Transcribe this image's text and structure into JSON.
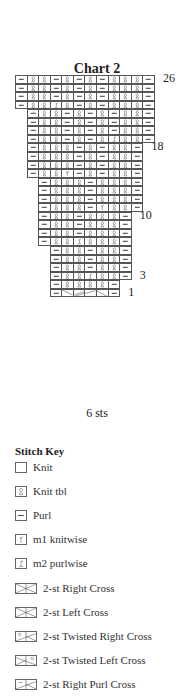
{
  "chart": {
    "title": "Chart  2",
    "width_label": "6 sts",
    "row_labels": [
      {
        "label": "26",
        "row": 26
      },
      {
        "label": "18",
        "row": 18
      },
      {
        "label": "10",
        "row": 10
      },
      {
        "label": "3",
        "row": 3
      },
      {
        "label": "1",
        "row": 1
      }
    ],
    "rows": [
      {
        "row": 26,
        "start": 0,
        "cells": [
          "P",
          "Ktbl",
          "Ktbl",
          "P",
          "Ktbl",
          "P",
          "Ktbl",
          "P",
          "Ktbl",
          "Ktbl",
          "Ktbl",
          "P"
        ]
      },
      {
        "row": 25,
        "start": 0,
        "cells": [
          "P",
          "Ktbl",
          "Ktbl",
          "P",
          "Ktbl",
          "P",
          "Ktbl",
          "P",
          "Ktbl",
          "Ktbl",
          "Ktbl",
          "P"
        ]
      },
      {
        "row": 24,
        "start": 0,
        "cells": [
          "P",
          "Ktbl",
          "Ktbl",
          "P",
          "Ktbl",
          "P",
          "Ktbl",
          "P",
          "Ktbl",
          "Ktbl",
          "Ktbl",
          "P"
        ]
      },
      {
        "row": 23,
        "start": 0,
        "cells": [
          "P",
          "Ktbl",
          "Ktbl",
          "M2P",
          "Ktbl",
          "P",
          "Ktbl",
          "P",
          "Ktbl",
          "Ktbl",
          "Ktbl",
          "P"
        ]
      },
      {
        "row": 22,
        "start": 1,
        "cells": [
          "P",
          "Ktbl",
          "Ktbl",
          "P",
          "Ktbl",
          "P",
          "Ktbl",
          "P",
          "Ktbl",
          "Ktbl",
          "P"
        ]
      },
      {
        "row": 21,
        "start": 1,
        "cells": [
          "P",
          "Ktbl",
          "Ktbl",
          "P",
          "Ktbl",
          "P",
          "Ktbl",
          "P",
          "Ktbl",
          "Ktbl",
          "P"
        ]
      },
      {
        "row": 20,
        "start": 1,
        "cells": [
          "P",
          "Ktbl",
          "Ktbl",
          "P",
          "Ktbl",
          "P",
          "Ktbl",
          "P",
          "Ktbl",
          "Ktbl",
          "P"
        ]
      },
      {
        "row": 19,
        "start": 1,
        "cells": [
          "P",
          "Ktbl",
          "Ktbl",
          "P",
          "Ktbl",
          "P",
          "Ktbl",
          "M2P",
          "Ktbl",
          "Ktbl",
          "P"
        ]
      },
      {
        "row": 18,
        "start": 1,
        "cells": [
          "P",
          "Ktbl",
          "Ktbl",
          "Ktbl",
          "P",
          "Ktbl",
          "P",
          "Ktbl",
          "Ktbl",
          "P"
        ]
      },
      {
        "row": 17,
        "start": 1,
        "cells": [
          "P",
          "Ktbl",
          "Ktbl",
          "Ktbl",
          "P",
          "Ktbl",
          "P",
          "Ktbl",
          "Ktbl",
          "P"
        ]
      },
      {
        "row": 16,
        "start": 1,
        "cells": [
          "P",
          "Ktbl",
          "Ktbl",
          "Ktbl",
          "P",
          "Ktbl",
          "P",
          "Ktbl",
          "Ktbl",
          "P"
        ]
      },
      {
        "row": 15,
        "start": 1,
        "cells": [
          "P",
          "Ktbl",
          "Ktbl",
          "M1K",
          "P",
          "Ktbl",
          "P",
          "Ktbl",
          "Ktbl",
          "P"
        ]
      },
      {
        "row": 14,
        "start": 2,
        "cells": [
          "P",
          "Ktbl",
          "Ktbl",
          "Ktbl",
          "P",
          "Ktbl",
          "Ktbl",
          "Ktbl",
          "P"
        ]
      },
      {
        "row": 13,
        "start": 2,
        "cells": [
          "P",
          "Ktbl",
          "Ktbl",
          "Ktbl",
          "P",
          "Ktbl",
          "Ktbl",
          "Ktbl",
          "P"
        ]
      },
      {
        "row": 12,
        "start": 2,
        "cells": [
          "P",
          "Ktbl",
          "Ktbl",
          "Ktbl",
          "P",
          "Ktbl",
          "Ktbl",
          "Ktbl",
          "P"
        ]
      },
      {
        "row": 11,
        "start": 2,
        "cells": [
          "P",
          "Ktbl",
          "Ktbl",
          "Ktbl",
          "P",
          "M1K",
          "Ktbl",
          "Ktbl",
          "P"
        ]
      },
      {
        "row": 10,
        "start": 2,
        "cells": [
          "P",
          "Ktbl",
          "Ktbl",
          "P",
          "Ktbl",
          "Ktbl",
          "Ktbl",
          "P"
        ]
      },
      {
        "row": 9,
        "start": 2,
        "cells": [
          "P",
          "Ktbl",
          "Ktbl",
          "P",
          "Ktbl",
          "Ktbl",
          "Ktbl",
          "P"
        ]
      },
      {
        "row": 8,
        "start": 2,
        "cells": [
          "P",
          "Ktbl",
          "Ktbl",
          "P",
          "Ktbl",
          "Ktbl",
          "Ktbl",
          "P"
        ]
      },
      {
        "row": 7,
        "start": 2,
        "cells": [
          "P",
          "Ktbl",
          "Ktbl",
          "M2P",
          "Ktbl",
          "Ktbl",
          "Ktbl",
          "P"
        ]
      },
      {
        "row": 6,
        "start": 3,
        "cells": [
          "P",
          "Ktbl",
          "Ktbl",
          "P",
          "Ktbl",
          "Ktbl",
          "P"
        ]
      },
      {
        "row": 5,
        "start": 3,
        "cells": [
          "P",
          "Ktbl",
          "Ktbl",
          "P",
          "Ktbl",
          "Ktbl",
          "P"
        ]
      },
      {
        "row": 4,
        "start": 3,
        "cells": [
          "P",
          "Ktbl",
          "Ktbl",
          "P",
          "Ktbl",
          "Ktbl",
          "P"
        ]
      },
      {
        "row": 3,
        "start": 3,
        "cells": [
          "P",
          "Ktbl",
          "Ktbl",
          "M2P",
          "Ktbl",
          "Ktbl",
          "P"
        ]
      },
      {
        "row": 2,
        "start": 3,
        "cells": [
          "P",
          "Ktbl",
          "Ktbl",
          "Ktbl",
          "Ktbl",
          "P"
        ]
      },
      {
        "row": 1,
        "start": 3,
        "cells": [
          "P",
          "RX1",
          "RX2",
          "LX1",
          "LX2",
          "P"
        ]
      }
    ]
  },
  "stitch_key": {
    "title": "Stitch Key",
    "items": [
      {
        "symbol": "knit",
        "label": "Knit"
      },
      {
        "symbol": "knit-tbl",
        "label": "Knit tbl"
      },
      {
        "symbol": "purl",
        "label": "Purl"
      },
      {
        "symbol": "m1-knitwise",
        "label": "m1 knitwise"
      },
      {
        "symbol": "m2-purlwise",
        "label": "m2 purlwise"
      },
      {
        "symbol": "2st-right-cross",
        "label": "2-st Right Cross"
      },
      {
        "symbol": "2st-left-cross",
        "label": "2-st Left Cross"
      },
      {
        "symbol": "2st-twisted-right-cross",
        "label": "2-st Twisted Right Cross"
      },
      {
        "symbol": "2st-twisted-left-cross",
        "label": "2-st Twisted Left Cross"
      },
      {
        "symbol": "2st-right-purl-cross",
        "label": "2-st Right Purl Cross"
      }
    ]
  },
  "colors": {
    "grid_line": "#555555",
    "symbol": "#444444",
    "text": "#222222",
    "background": "#ffffff"
  }
}
